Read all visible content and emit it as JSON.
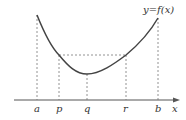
{
  "diagram": {
    "curve_label": "y=f(x)",
    "x_axis_label": "x",
    "points": [
      {
        "name": "a",
        "x": 36
      },
      {
        "name": "p",
        "x": 59
      },
      {
        "name": "q",
        "x": 87
      },
      {
        "name": "r",
        "x": 126
      },
      {
        "name": "b",
        "x": 158
      }
    ],
    "colors": {
      "curve": "#444444",
      "axis": "#555555",
      "guides": "#777777"
    }
  }
}
